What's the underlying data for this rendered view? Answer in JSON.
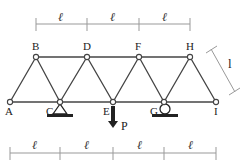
{
  "diagram": {
    "type": "truss",
    "top_nodes": [
      {
        "id": "B",
        "x": 36,
        "y": 57
      },
      {
        "id": "D",
        "x": 87,
        "y": 57
      },
      {
        "id": "F",
        "x": 139,
        "y": 57
      },
      {
        "id": "H",
        "x": 190,
        "y": 57
      }
    ],
    "bottom_nodes": [
      {
        "id": "A",
        "x": 10,
        "y": 102
      },
      {
        "id": "C",
        "x": 60,
        "y": 102
      },
      {
        "id": "E",
        "x": 113,
        "y": 102
      },
      {
        "id": "G",
        "x": 164,
        "y": 102
      },
      {
        "id": "I",
        "x": 216,
        "y": 102
      }
    ],
    "labels": {
      "A": "A",
      "B": "B",
      "C": "C",
      "D": "D",
      "E": "E",
      "F": "F",
      "G": "G",
      "H": "H",
      "I": "I"
    },
    "load": {
      "label": "P",
      "node": "E",
      "direction": "down"
    },
    "supports": [
      {
        "node": "C",
        "type": "pin"
      },
      {
        "node": "G",
        "type": "roller"
      }
    ],
    "dimensions": {
      "top_symbol": "ℓ",
      "top_count": 3,
      "bottom_symbol": "ℓ",
      "bottom_count": 4,
      "side_symbol": "l"
    },
    "colors": {
      "member": "#444444",
      "dimension": "#999999",
      "support": "#222222"
    }
  }
}
